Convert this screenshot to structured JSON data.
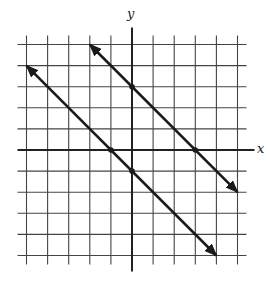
{
  "chart_data": {
    "type": "line",
    "title": "",
    "xlabel": "x",
    "ylabel": "y",
    "xlim": [
      -5,
      5
    ],
    "ylim": [
      -5,
      5
    ],
    "grid": true,
    "grid_step": 1,
    "tick_labels": "none",
    "series": [
      {
        "name": "line-upper",
        "equation": "y = -x + 3",
        "x": [
          -2,
          5
        ],
        "y": [
          5,
          -2
        ],
        "arrows": "both",
        "marked_points": [
          [
            0,
            3
          ],
          [
            3,
            0
          ]
        ]
      },
      {
        "name": "line-lower",
        "equation": "y = -x - 1",
        "x": [
          -5,
          4
        ],
        "y": [
          4,
          -5
        ],
        "arrows": "both",
        "marked_points": [
          [
            -1,
            0
          ],
          [
            0,
            -1
          ]
        ]
      }
    ]
  },
  "labels": {
    "x": "x",
    "y": "y"
  },
  "colors": {
    "grid": "#444444",
    "axis": "#222222",
    "line": "#1a1a1a"
  }
}
